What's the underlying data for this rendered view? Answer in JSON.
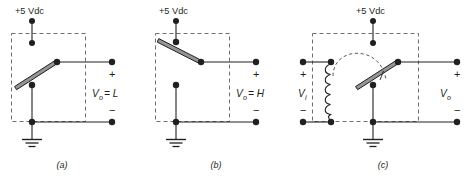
{
  "figure": {
    "colors": {
      "wire": "#231f20",
      "dashed_box": "#6d6e71",
      "node": "#231f20",
      "arm_fill": "#939598",
      "background": "#ffffff"
    },
    "panels": [
      {
        "id": "a",
        "panel_label": "(a)",
        "supply_label": "+5 Vdc",
        "output_label": "V",
        "output_sub": "o",
        "output_value": "= L",
        "plus_sign": "+",
        "minus_sign": "−",
        "switch_state": "closed-to-ground",
        "description": "Relay contact connected to ground, output low"
      },
      {
        "id": "b",
        "panel_label": "(b)",
        "supply_label": "+5 Vdc",
        "output_label": "V",
        "output_sub": "o",
        "output_value": "= H",
        "plus_sign": "+",
        "minus_sign": "−",
        "switch_state": "closed-to-supply",
        "description": "Relay contact connected to +5 Vdc, output high"
      },
      {
        "id": "c",
        "panel_label": "(c)",
        "supply_label": "+5 Vdc",
        "input_label": "V",
        "input_sub": "i",
        "output_label": "V",
        "output_sub": "o",
        "input_plus_sign": "+",
        "input_minus_sign": "−",
        "plus_sign": "+",
        "minus_sign": "−",
        "switch_state": "coil-actuated",
        "description": "Relay coil with dashed actuation arc driving the contact"
      }
    ]
  }
}
